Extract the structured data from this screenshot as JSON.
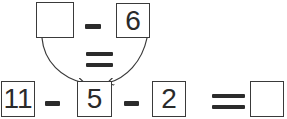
{
  "top_equation": {
    "left_box": "",
    "operator": "minus",
    "right_box": "6"
  },
  "middle_relation": "equals",
  "bottom_equation": {
    "boxes": [
      "11",
      "5",
      "2"
    ],
    "operators": [
      "minus",
      "minus"
    ],
    "result_relation": "equals",
    "result_box": ""
  },
  "arrows": [
    {
      "from": "top-left-box",
      "to": "bottom-box-5"
    },
    {
      "from": "top-right-box-6",
      "to": "bottom-box-5"
    }
  ],
  "colors": {
    "ink": "#2b2b2b",
    "border": "#3a3a3a",
    "background": "#ffffff"
  }
}
